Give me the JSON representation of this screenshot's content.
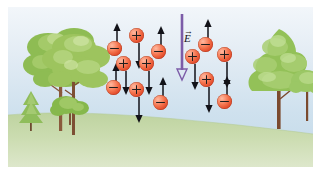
{
  "figure": {
    "type": "physics-illustration",
    "width": 323,
    "height": 176,
    "background_color": "#ffffff"
  },
  "scene": {
    "sky": {
      "name": "sky",
      "color_top": "#f2f6fa",
      "color_bottom": "#c2d9e8"
    },
    "ground": {
      "name": "grassy-ground",
      "color_top": "#c3d6a6",
      "color_bottom": "#d8e4c4"
    },
    "trees": [
      {
        "id": "tree-tall-left-a",
        "kind": "deciduous-tall",
        "x": 22,
        "y": 18,
        "trunk_color": "#8a5a3c",
        "foliage_color": "#8cb84f"
      },
      {
        "id": "tree-tall-left-b",
        "kind": "deciduous-tall",
        "x": 42,
        "y": 22,
        "trunk_color": "#7d4f34",
        "foliage_color": "#9dc45e"
      },
      {
        "id": "tree-small-conifer",
        "kind": "conifer-small",
        "x": 12,
        "y": 88,
        "trunk_color": "#6e4a30",
        "foliage_color": "#8fbd5b"
      },
      {
        "id": "tree-shrub-left",
        "kind": "shrub",
        "x": 52,
        "y": 92,
        "trunk_color": "#7a5336",
        "foliage_color": "#86b84c"
      },
      {
        "id": "tree-large-right",
        "kind": "deciduous-large",
        "x": 252,
        "y": 26,
        "trunk_color": "#7b4a2e",
        "foliage_color": "#93c158"
      },
      {
        "id": "tree-small-right",
        "kind": "deciduous-small",
        "x": 296,
        "y": 68,
        "trunk_color": "#7b4a2e",
        "foliage_color": "#9bc765"
      }
    ]
  },
  "efield": {
    "name": "electric-field-vector",
    "label": "E",
    "vector_accent": "→",
    "direction": "down",
    "color": "#7c5ca8",
    "x": 174,
    "y_top": 14,
    "length": 62,
    "label_x": 180,
    "label_y": 30
  },
  "charges": [
    {
      "id": "c1",
      "sign": "minus",
      "x": 106,
      "y": 41,
      "arrow": "up",
      "arrow_len": 22
    },
    {
      "id": "c2",
      "sign": "plus",
      "x": 128,
      "y": 28,
      "arrow": "down",
      "arrow_len": 22
    },
    {
      "id": "c3",
      "sign": "minus",
      "x": 150,
      "y": 44,
      "arrow": "up",
      "arrow_len": 22
    },
    {
      "id": "c4",
      "sign": "plus",
      "x": 115,
      "y": 56,
      "arrow": "down",
      "arrow_len": 20
    },
    {
      "id": "c5",
      "sign": "plus",
      "x": 138,
      "y": 56,
      "arrow": "down",
      "arrow_len": 20
    },
    {
      "id": "c6",
      "sign": "minus",
      "x": 105,
      "y": 80,
      "arrow": "up",
      "arrow_len": 20
    },
    {
      "id": "c7",
      "sign": "plus",
      "x": 128,
      "y": 82,
      "arrow": "down",
      "arrow_len": 22
    },
    {
      "id": "c8",
      "sign": "minus",
      "x": 152,
      "y": 95,
      "arrow": "up",
      "arrow_len": 22
    },
    {
      "id": "c9",
      "sign": "minus",
      "x": 197,
      "y": 37,
      "arrow": "up",
      "arrow_len": 22
    },
    {
      "id": "c10",
      "sign": "plus",
      "x": 184,
      "y": 49,
      "arrow": "down",
      "arrow_len": 22
    },
    {
      "id": "c11",
      "sign": "plus",
      "x": 216,
      "y": 47,
      "arrow": "down",
      "arrow_len": 22
    },
    {
      "id": "c12",
      "sign": "plus",
      "x": 198,
      "y": 72,
      "arrow": "down",
      "arrow_len": 22
    },
    {
      "id": "c13",
      "sign": "minus",
      "x": 216,
      "y": 94,
      "arrow": "up",
      "arrow_len": 22
    }
  ],
  "legend": {
    "plus_label": "+",
    "minus_label": "−",
    "charge_color": "#e8552f",
    "arrow_color": "#121218"
  }
}
